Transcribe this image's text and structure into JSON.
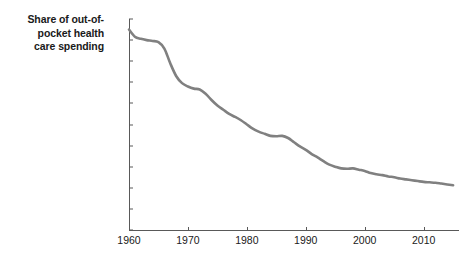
{
  "chart_data": {
    "type": "line",
    "title_lines": [
      "Share of out-of-",
      "pocket health",
      "care spending"
    ],
    "xlabel": "",
    "ylabel": "",
    "xlim": [
      1960,
      2016
    ],
    "ylim": [
      0,
      50
    ],
    "grid": false,
    "legend": false,
    "line_color": "#808080",
    "axis_color": "#595959",
    "y_ticks": [
      0,
      5,
      10,
      15,
      20,
      25,
      30,
      35,
      40,
      45,
      50
    ],
    "y_tick_labels": [
      "0",
      "5",
      "10",
      "15",
      "20",
      "25",
      "30",
      "35",
      "40",
      "45",
      "50%"
    ],
    "x_ticks": [
      1960,
      1970,
      1980,
      1990,
      2000,
      2010
    ],
    "x_tick_labels": [
      "1960",
      "1970",
      "1980",
      "1990",
      "2000",
      "2010"
    ],
    "series": [
      {
        "name": "Share of out-of-pocket health care spending",
        "x": [
          1960,
          1961,
          1962,
          1963,
          1964,
          1965,
          1966,
          1967,
          1968,
          1969,
          1970,
          1971,
          1972,
          1973,
          1974,
          1975,
          1976,
          1977,
          1978,
          1979,
          1980,
          1981,
          1982,
          1983,
          1984,
          1985,
          1986,
          1987,
          1988,
          1989,
          1990,
          1991,
          1992,
          1993,
          1994,
          1995,
          1996,
          1997,
          1998,
          1999,
          2000,
          2001,
          2002,
          2003,
          2004,
          2005,
          2006,
          2007,
          2008,
          2009,
          2010,
          2011,
          2012,
          2013,
          2014,
          2015
        ],
        "values": [
          47.5,
          45.8,
          45.3,
          45.0,
          44.8,
          44.5,
          43.0,
          39.5,
          36.5,
          34.8,
          34.0,
          33.5,
          33.3,
          32.3,
          30.8,
          29.5,
          28.5,
          27.5,
          26.8,
          26.0,
          25.0,
          24.0,
          23.3,
          22.8,
          22.3,
          22.2,
          22.3,
          21.8,
          20.8,
          19.8,
          19.0,
          18.0,
          17.2,
          16.3,
          15.5,
          15.0,
          14.6,
          14.5,
          14.6,
          14.3,
          14.0,
          13.5,
          13.2,
          13.0,
          12.7,
          12.5,
          12.2,
          12.0,
          11.8,
          11.6,
          11.4,
          11.3,
          11.2,
          11.0,
          10.8,
          10.6
        ]
      }
    ]
  }
}
